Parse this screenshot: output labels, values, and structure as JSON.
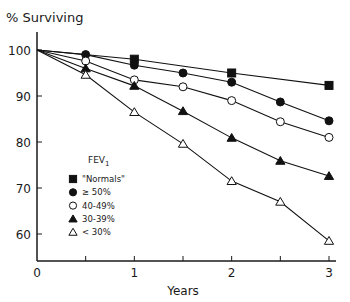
{
  "chart_data": {
    "type": "line",
    "title": "",
    "ylabel": "% Surviving",
    "xlabel": "Years",
    "xlim": [
      0,
      3
    ],
    "ylim": [
      55.5,
      100
    ],
    "x_ticks": [
      0,
      0.5,
      1,
      1.5,
      2,
      2.5,
      3
    ],
    "x_tick_labels": [
      "0",
      "",
      "1",
      "",
      "2",
      "",
      "3"
    ],
    "y_ticks": [
      100,
      90,
      80,
      70,
      60
    ],
    "y_tick_labels": [
      "100",
      "90",
      "80",
      "70",
      "60"
    ],
    "grid": false,
    "legend": {
      "title": "FEV",
      "title_subscript": "1",
      "placement": "center-left"
    },
    "series": [
      {
        "name": "\"Normals\"",
        "marker": "square-filled",
        "x": [
          0,
          1,
          2,
          3
        ],
        "values": [
          100,
          98,
          95,
          92.3
        ]
      },
      {
        "name": "≥ 50%",
        "marker": "circle-filled",
        "x": [
          0,
          0.5,
          1,
          1.5,
          2,
          2.5,
          3
        ],
        "values": [
          100,
          99,
          96.7,
          95,
          93,
          88.7,
          84.6
        ]
      },
      {
        "name": "40-49%",
        "marker": "circle-open",
        "x": [
          0,
          0.5,
          1,
          1.5,
          2,
          2.5,
          3
        ],
        "values": [
          100,
          97.6,
          93.5,
          92,
          89,
          84.4,
          81
        ]
      },
      {
        "name": "30-39%",
        "marker": "triangle-filled",
        "x": [
          0,
          0.5,
          1,
          1.5,
          2,
          2.5,
          3
        ],
        "values": [
          100,
          96,
          92.2,
          86.7,
          80.9,
          75.9,
          72.6
        ]
      },
      {
        "name": "< 30%",
        "marker": "triangle-open",
        "x": [
          0,
          0.5,
          1,
          1.5,
          2,
          2.5,
          3
        ],
        "values": [
          100,
          94.6,
          86.5,
          79.6,
          71.5,
          67,
          58.5
        ]
      }
    ]
  }
}
